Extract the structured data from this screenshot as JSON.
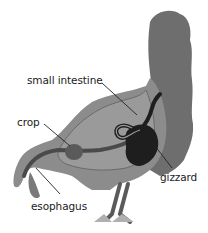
{
  "diagram": {
    "labels": {
      "small_intestine": "small intestine",
      "crop": "crop",
      "gizzard": "gizzard",
      "esophagus": "esophagus"
    },
    "colors": {
      "background": "#ffffff",
      "feathers": "#6e6e6e",
      "body": "#8c8c8c",
      "cavity": "#9a9a9a",
      "organs_dark": "#1e1e1e",
      "crop": "#5a5a5a",
      "leader_lines": "#222222"
    }
  }
}
